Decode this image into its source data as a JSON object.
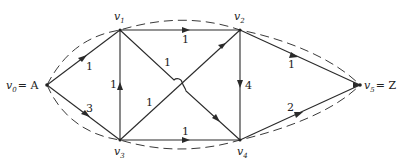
{
  "diagram": {
    "title": "",
    "nodes": [
      {
        "id": "v0",
        "label": "v",
        "sub": "0",
        "suffix": " = A",
        "x": 47,
        "y": 85
      },
      {
        "id": "v1",
        "label": "v",
        "sub": "1",
        "suffix": "",
        "x": 120,
        "y": 30
      },
      {
        "id": "v2",
        "label": "v",
        "sub": "2",
        "suffix": "",
        "x": 240,
        "y": 30
      },
      {
        "id": "v3",
        "label": "v",
        "sub": "3",
        "suffix": "",
        "x": 120,
        "y": 140
      },
      {
        "id": "v4",
        "label": "v",
        "sub": "4",
        "suffix": "",
        "x": 240,
        "y": 140
      },
      {
        "id": "v5",
        "label": "v",
        "sub": "5",
        "suffix": " = Z",
        "x": 360,
        "y": 85
      }
    ],
    "edges": [
      {
        "from": "v0",
        "to": "v1",
        "weight": "1"
      },
      {
        "from": "v0",
        "to": "v3",
        "weight": "3"
      },
      {
        "from": "v1",
        "to": "v2",
        "weight": "1"
      },
      {
        "from": "v1",
        "to": "v4",
        "weight": "1"
      },
      {
        "from": "v3",
        "to": "v1",
        "weight": "1"
      },
      {
        "from": "v3",
        "to": "v2",
        "weight": "1"
      },
      {
        "from": "v2",
        "to": "v4",
        "weight": "4"
      },
      {
        "from": "v3",
        "to": "v4",
        "weight": "1"
      },
      {
        "from": "v2",
        "to": "v5",
        "weight": "1"
      },
      {
        "from": "v4",
        "to": "v5",
        "weight": "2"
      }
    ],
    "dashed_paths": [
      {
        "name": "upper-cut",
        "through": [
          "v0",
          "v1",
          "v2",
          "v5"
        ]
      },
      {
        "name": "lower-cut",
        "through": [
          "v0",
          "v3",
          "v4",
          "v5"
        ]
      }
    ],
    "labels": {
      "v0": {
        "main": "v",
        "sub": "0",
        "suffix": "= A"
      },
      "v1": {
        "main": "v",
        "sub": "1"
      },
      "v2": {
        "main": "v",
        "sub": "2"
      },
      "v3": {
        "main": "v",
        "sub": "3"
      },
      "v4": {
        "main": "v",
        "sub": "4"
      },
      "v5": {
        "main": "v",
        "sub": "5",
        "suffix": "= Z"
      }
    },
    "weights": {
      "v0_v1": "1",
      "v0_v3": "3",
      "v1_v2": "1",
      "v1_v4": "1",
      "v3_v1": "1",
      "v3_v2": "1",
      "v2_v4": "4",
      "v3_v4": "1",
      "v2_v5": "1",
      "v4_v5": "2"
    }
  }
}
